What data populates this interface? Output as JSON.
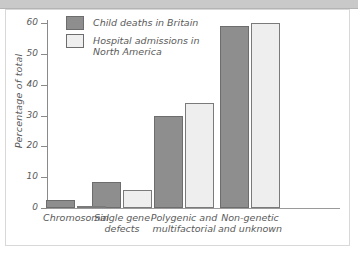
{
  "figure": {
    "header_band": "",
    "background_color": "#ffffff",
    "frame_color": "#d8d8d8"
  },
  "legend": {
    "position": "top-left-inside",
    "entries": [
      {
        "label": "Child deaths in Britain",
        "color": "#8e8e8e",
        "swatch": "dark"
      },
      {
        "label": "Hospital admissions in\nNorth America",
        "color": "#efefef",
        "swatch": "light"
      }
    ]
  },
  "chart_data": {
    "type": "bar",
    "title": "",
    "xlabel": "",
    "ylabel": "Percentage of total",
    "ylim": [
      0,
      62
    ],
    "yticks": [
      0,
      10,
      20,
      30,
      40,
      50,
      60
    ],
    "ytick_labels": [
      "0",
      "10",
      "20",
      "30",
      "40",
      "50",
      "60"
    ],
    "grid": false,
    "legend_position": "top-left-inside",
    "categories": [
      "Chromosomal",
      "Single gene\ndefects",
      "Polygenic and\nmultifactorial",
      "Non-genetic\nand unknown"
    ],
    "series": [
      {
        "name": "Child deaths in Britain",
        "color": "#8e8e8e",
        "values": [
          2.5,
          8.5,
          30,
          59
        ]
      },
      {
        "name": "Hospital admissions in North America",
        "color": "#efefef",
        "values": [
          0.8,
          6,
          34,
          60
        ]
      }
    ]
  }
}
